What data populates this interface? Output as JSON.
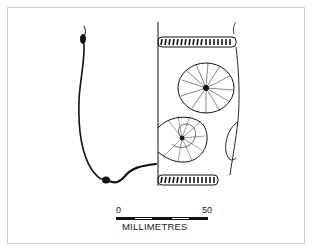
{
  "figure": {
    "type": "archaeological pottery profile drawing",
    "scale_bar": {
      "start_label": "0",
      "end_label": "50",
      "unit_label": "MILLIMETRES",
      "segments": [
        "dark",
        "light",
        "dark",
        "light",
        "dark"
      ]
    },
    "colors": {
      "ink": "#111111",
      "frame": "#cfcfcf",
      "background": "#ffffff"
    }
  }
}
